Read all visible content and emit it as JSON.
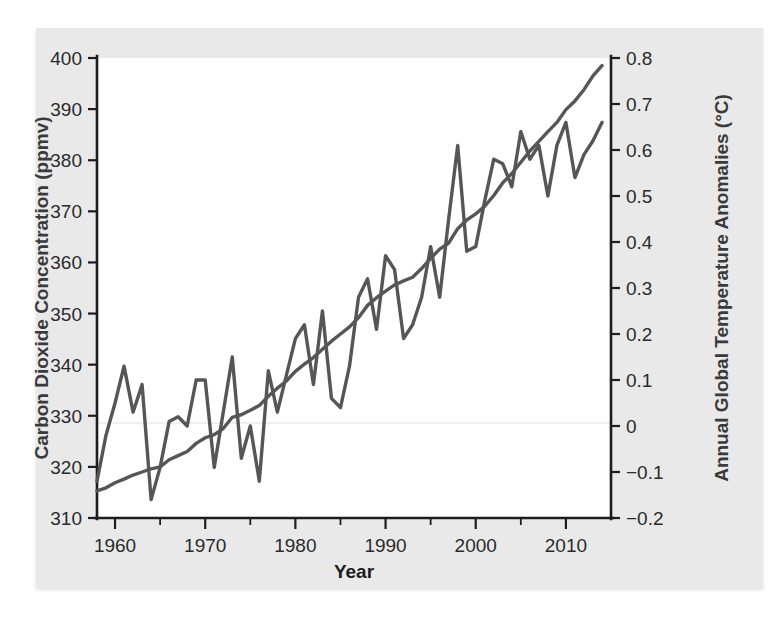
{
  "figure": {
    "background_color": "#e9e9e9",
    "plot_background_color": "#ffffff",
    "axis_color": "#1d1d1d"
  },
  "chart_data": {
    "type": "line",
    "title": "",
    "subtitle": "",
    "xlabel": "Year",
    "grid": false,
    "legend": "none",
    "annotations": [],
    "x_axis": {
      "label": "Year",
      "ticks": [
        1960,
        1970,
        1980,
        1990,
        2000,
        2010
      ],
      "tick_labels": [
        "1960",
        "1970",
        "1980",
        "1990",
        "2000",
        "2010"
      ],
      "minor_ticks": [
        1965,
        1975,
        1985,
        1995,
        2005
      ],
      "xlim": [
        1958,
        2015
      ]
    },
    "y_axis_left": {
      "label": "Carbon Dioxide Concentration (ppmv)",
      "ticks": [
        310,
        320,
        330,
        340,
        350,
        360,
        370,
        380,
        390,
        400
      ],
      "tick_labels": [
        "310",
        "320",
        "330",
        "340",
        "350",
        "360",
        "370",
        "380",
        "390",
        "400"
      ],
      "ylim": [
        310,
        400
      ],
      "units": "ppmv",
      "color": "#565656"
    },
    "y_axis_right": {
      "label": "Annual Global Temperature Anomalies (°C)",
      "ticks": [
        -0.2,
        -0.1,
        0,
        0.1,
        0.2,
        0.3,
        0.4,
        0.5,
        0.6,
        0.7,
        0.8
      ],
      "tick_labels": [
        "−0.2",
        "−0.1",
        "0",
        "0.1",
        "0.2",
        "0.3",
        "0.4",
        "0.5",
        "0.6",
        "0.7",
        "0.8"
      ],
      "ylim": [
        -0.2,
        0.8
      ],
      "units": "°C",
      "color": "#565656"
    },
    "series": [
      {
        "name": "Carbon Dioxide Concentration",
        "axis": "left",
        "color": "#565656",
        "line_width": 3.4,
        "x": [
          1958,
          1959,
          1960,
          1961,
          1962,
          1963,
          1964,
          1965,
          1966,
          1967,
          1968,
          1969,
          1970,
          1971,
          1972,
          1973,
          1974,
          1975,
          1976,
          1977,
          1978,
          1979,
          1980,
          1981,
          1982,
          1983,
          1984,
          1985,
          1986,
          1987,
          1988,
          1989,
          1990,
          1991,
          1992,
          1993,
          1994,
          1995,
          1996,
          1997,
          1998,
          1999,
          2000,
          2001,
          2002,
          2003,
          2004,
          2005,
          2006,
          2007,
          2008,
          2009,
          2010,
          2011,
          2012,
          2013,
          2014
        ],
        "values": [
          315.3,
          315.9,
          316.9,
          317.6,
          318.4,
          319.0,
          319.6,
          320.0,
          321.4,
          322.2,
          323.0,
          324.6,
          325.7,
          326.3,
          327.5,
          329.7,
          330.2,
          331.1,
          332.0,
          333.8,
          335.4,
          336.8,
          338.7,
          340.1,
          341.4,
          343.0,
          344.6,
          346.0,
          347.4,
          349.2,
          351.6,
          353.1,
          354.4,
          355.6,
          356.4,
          357.1,
          358.8,
          360.8,
          362.6,
          363.8,
          366.6,
          368.3,
          369.5,
          371.0,
          373.1,
          375.6,
          377.4,
          379.6,
          381.8,
          383.7,
          385.6,
          387.4,
          389.9,
          391.6,
          393.8,
          396.5,
          398.5
        ]
      },
      {
        "name": "Annual Global Temperature Anomalies",
        "axis": "right",
        "color": "#565656",
        "line_width": 3.4,
        "x": [
          1958,
          1959,
          1960,
          1961,
          1962,
          1963,
          1964,
          1965,
          1966,
          1967,
          1968,
          1969,
          1970,
          1971,
          1972,
          1973,
          1974,
          1975,
          1976,
          1977,
          1978,
          1979,
          1980,
          1981,
          1982,
          1983,
          1984,
          1985,
          1986,
          1987,
          1988,
          1989,
          1990,
          1991,
          1992,
          1993,
          1994,
          1995,
          1996,
          1997,
          1998,
          1999,
          2000,
          2001,
          2002,
          2003,
          2004,
          2005,
          2006,
          2007,
          2008,
          2009,
          2010,
          2011,
          2012,
          2013,
          2014
        ],
        "values": [
          -0.12,
          -0.02,
          0.05,
          0.13,
          0.03,
          0.09,
          -0.16,
          -0.09,
          0.01,
          0.02,
          0.0,
          0.1,
          0.1,
          -0.09,
          0.03,
          0.15,
          -0.07,
          0.0,
          -0.12,
          0.12,
          0.03,
          0.11,
          0.19,
          0.22,
          0.09,
          0.25,
          0.06,
          0.04,
          0.13,
          0.28,
          0.32,
          0.21,
          0.37,
          0.34,
          0.19,
          0.22,
          0.28,
          0.39,
          0.28,
          0.45,
          0.61,
          0.38,
          0.39,
          0.49,
          0.58,
          0.57,
          0.52,
          0.64,
          0.58,
          0.61,
          0.5,
          0.61,
          0.66,
          0.54,
          0.59,
          0.62,
          0.66
        ]
      }
    ]
  }
}
